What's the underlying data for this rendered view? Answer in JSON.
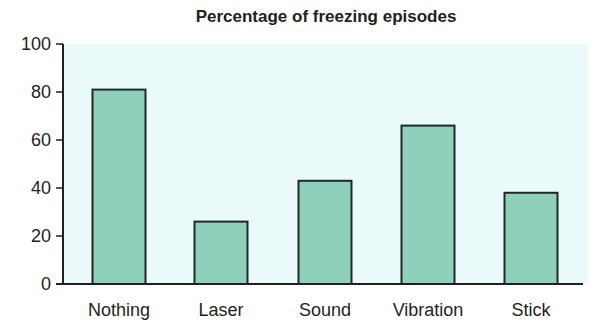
{
  "chart_data": {
    "type": "bar",
    "title": "Percentage of freezing episodes",
    "xlabel": "",
    "ylabel": "",
    "categories": [
      "Nothing",
      "Laser",
      "Sound",
      "Vibration",
      "Stick"
    ],
    "values": [
      81,
      26,
      43,
      66,
      38
    ],
    "ylim": [
      0,
      100
    ],
    "yticks": [
      0,
      20,
      40,
      60,
      80,
      100
    ],
    "grid": false,
    "legend": null,
    "colors": {
      "bar_fill": "#8fd0bd",
      "bar_stroke": "#1e2a28",
      "plot_background": "#eaf9f9",
      "axis": "#231f20"
    }
  }
}
